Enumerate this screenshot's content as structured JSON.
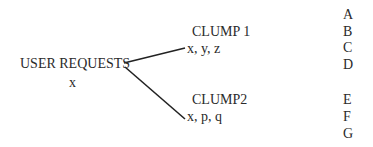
{
  "root": {
    "title": "USER REQUESTS",
    "items": "x"
  },
  "clumps": [
    {
      "title": "CLUMP 1",
      "items": "x, y, z"
    },
    {
      "title": "CLUMP2",
      "items": "x, p, q"
    }
  ],
  "row_labels": [
    "A",
    "B",
    "C",
    "D",
    "E",
    "F",
    "G"
  ]
}
